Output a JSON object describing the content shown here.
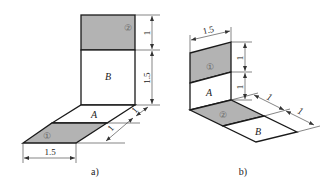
{
  "colors": {
    "shaded": "#b3b3b3",
    "line": "#1a1a1a",
    "background": "#ffffff"
  },
  "figure_a": {
    "caption": "a)",
    "wall_top_marker": "②",
    "wall_label": "B",
    "floor_label": "A",
    "floor_front_marker": "①",
    "dim_wall_top": "1",
    "dim_wall_bottom": "1.5",
    "dim_floor_depth_back": "1",
    "dim_floor_depth_front": "1",
    "dim_floor_width": "1.5"
  },
  "figure_b": {
    "caption": "b)",
    "dim_wall_width": "1.5",
    "wall_top_marker": "①",
    "wall_label": "A",
    "floor_marker": "②",
    "floor_label": "B",
    "dim_wall_top": "1",
    "dim_wall_bottom": "1",
    "dim_floor_first": "1",
    "dim_floor_second": "1"
  }
}
